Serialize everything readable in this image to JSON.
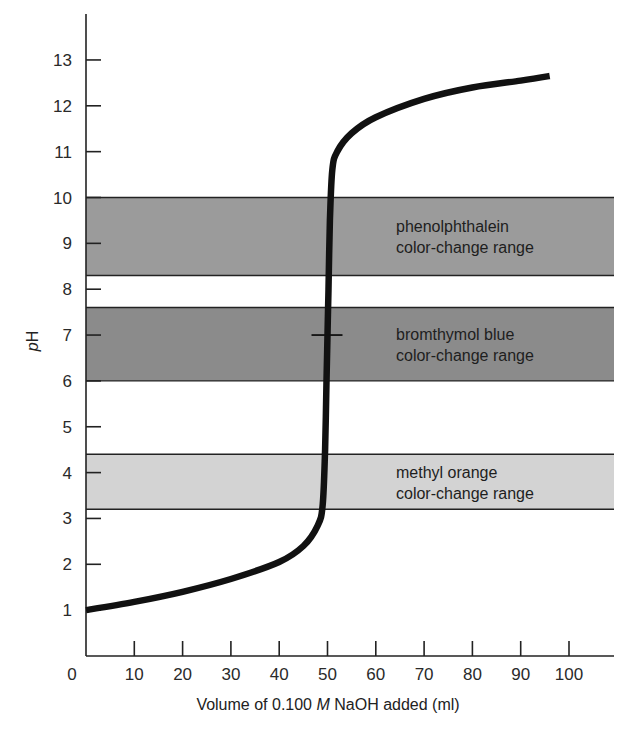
{
  "chart_data": {
    "type": "line",
    "title": "",
    "xlabel": "Volume of 0.100 M NaOH added (ml)",
    "xlabel_parts": {
      "pre": "Volume of 0.100 ",
      "italic": "M",
      "post": " NaOH added (ml)"
    },
    "ylabel": "pH",
    "ylabel_parts": {
      "italic": "p",
      "rest": "H"
    },
    "xlim": [
      0,
      110
    ],
    "ylim": [
      0,
      14
    ],
    "x_ticks": [
      0,
      10,
      20,
      30,
      40,
      50,
      60,
      70,
      80,
      90,
      100
    ],
    "y_ticks": [
      1,
      2,
      3,
      4,
      5,
      6,
      7,
      8,
      9,
      10,
      11,
      12,
      13
    ],
    "grid": false,
    "legend": "none",
    "series": [
      {
        "name": "Titration curve",
        "color": "#111111",
        "x": [
          0,
          10,
          20,
          30,
          40,
          45,
          48,
          49,
          49.5,
          49.8,
          50,
          50.2,
          50.5,
          51,
          52,
          55,
          60,
          70,
          80,
          90,
          96
        ],
        "y": [
          1.0,
          1.18,
          1.4,
          1.68,
          2.05,
          2.4,
          2.85,
          3.3,
          4.5,
          6.0,
          7.0,
          8.0,
          9.5,
          10.6,
          11.0,
          11.4,
          11.75,
          12.15,
          12.4,
          12.55,
          12.65
        ]
      }
    ],
    "bands": [
      {
        "name": "phenolphthalein",
        "label_line1": "phenolphthalein",
        "label_line2": "color-change range",
        "ph_low": 8.3,
        "ph_high": 10.0,
        "color": "#9b9b9b"
      },
      {
        "name": "bromthymol-blue",
        "label_line1": "bromthymol blue",
        "label_line2": "color-change range",
        "ph_low": 6.0,
        "ph_high": 7.6,
        "color": "#8b8b8b"
      },
      {
        "name": "methyl-orange",
        "label_line1": "methyl orange",
        "label_line2": "color-change range",
        "ph_low": 3.2,
        "ph_high": 4.4,
        "color": "#d3d3d3"
      }
    ],
    "annotations": [
      {
        "type": "equivalence-point-marker",
        "x": 50,
        "y": 7
      }
    ]
  }
}
